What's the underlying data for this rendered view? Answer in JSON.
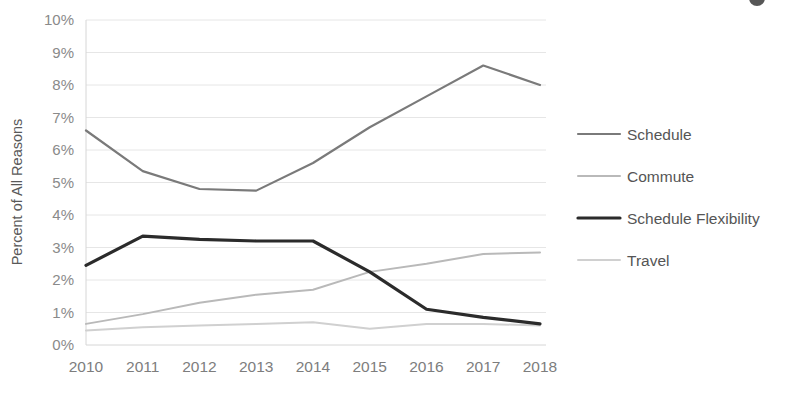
{
  "chart_data": {
    "type": "line",
    "title": "",
    "xlabel": "",
    "ylabel": "Percent of All Reasons",
    "x": [
      "2010",
      "2011",
      "2012",
      "2013",
      "2014",
      "2015",
      "2016",
      "2017",
      "2018"
    ],
    "categories": [
      "2010",
      "2011",
      "2012",
      "2013",
      "2014",
      "2015",
      "2016",
      "2017",
      "2018"
    ],
    "ylim": [
      0,
      10
    ],
    "ytick_labels": [
      "10%",
      "9%",
      "8%",
      "7%",
      "6%",
      "5%",
      "4%",
      "3%",
      "2%",
      "1%",
      "0%"
    ],
    "ytick_values": [
      10,
      9,
      8,
      7,
      6,
      5,
      4,
      3,
      2,
      1,
      0
    ],
    "grid": true,
    "legend_position": "right",
    "series": [
      {
        "name": "Schedule",
        "color": "#7a7a7a",
        "width": 2.2,
        "values": [
          6.6,
          5.35,
          4.8,
          4.75,
          5.6,
          6.7,
          7.65,
          8.6,
          8.0
        ]
      },
      {
        "name": "Commute",
        "color": "#b9b9b9",
        "width": 2.0,
        "values": [
          0.65,
          0.95,
          1.3,
          1.55,
          1.7,
          2.25,
          2.5,
          2.8,
          2.85
        ]
      },
      {
        "name": "Schedule Flexibility",
        "color": "#2b2b2b",
        "width": 3.2,
        "values": [
          2.45,
          3.35,
          3.25,
          3.2,
          3.2,
          2.25,
          1.1,
          0.85,
          0.65
        ]
      },
      {
        "name": "Travel",
        "color": "#d0d0d0",
        "width": 2.0,
        "values": [
          0.45,
          0.55,
          0.6,
          0.65,
          0.7,
          0.5,
          0.65,
          0.65,
          0.6
        ]
      }
    ]
  },
  "legend": {
    "items": [
      {
        "label": "Schedule"
      },
      {
        "label": "Commute"
      },
      {
        "label": "Schedule Flexibility"
      },
      {
        "label": "Travel"
      }
    ]
  }
}
